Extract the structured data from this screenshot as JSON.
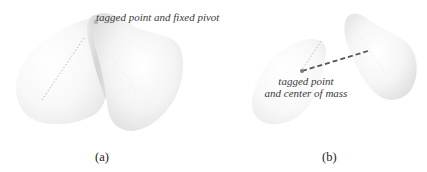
{
  "figure": {
    "panels": [
      {
        "id": "a",
        "label": "(a)",
        "annotation": "tagged point and fixed pivot",
        "description": "Two overlapping rigid bodies rotating about a shared tagged point which is also a fixed pivot"
      },
      {
        "id": "b",
        "label": "(b)",
        "annotation_line1": "tagged point",
        "annotation_line2": "and center of mass",
        "description": "Two separated rigid bodies; tagged point coincides with center of mass, dashed line indicates translation"
      }
    ]
  },
  "colors": {
    "shape_light": "#fbfbfb",
    "shape_mid": "#ececec",
    "shape_shadow": "#c9c9c9",
    "dashed_line": "#555555",
    "dotted_line": "#b5b5b5",
    "text": "#333333"
  }
}
